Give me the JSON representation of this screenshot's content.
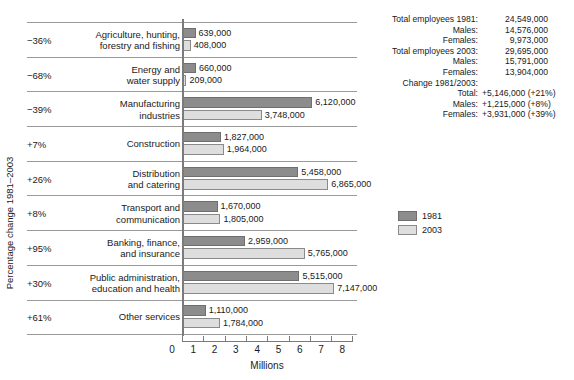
{
  "chart_data": {
    "type": "bar",
    "title": "",
    "xlabel": "Millions",
    "ylabel": "Percentage change 1981–2003",
    "xlim": [
      0,
      8
    ],
    "xticks": [
      0,
      1,
      2,
      3,
      4,
      5,
      6,
      7,
      8
    ],
    "grid": false,
    "legend_position": "right",
    "orientation": "horizontal",
    "categories": [
      "Agriculture, hunting, forestry and fishing",
      "Energy and water supply",
      "Manufacturing industries",
      "Construction",
      "Distribution and catering",
      "Transport and communication",
      "Banking, finance, and insurance",
      "Public administration, education and health",
      "Other services"
    ],
    "series": [
      {
        "name": "1981",
        "color": "#8c8c8c",
        "values": [
          639000,
          660000,
          6120000,
          1827000,
          5458000,
          1670000,
          2959000,
          5515000,
          1110000
        ],
        "labels": [
          "639,000",
          "660,000",
          "6,120,000",
          "1,827,000",
          "5,458,000",
          "1,670,000",
          "2,959,000",
          "5,515,000",
          "1,110,000"
        ]
      },
      {
        "name": "2003",
        "color": "#dedede",
        "values": [
          408000,
          209000,
          3748000,
          1964000,
          6865000,
          1805000,
          5765000,
          7147000,
          1784000
        ],
        "labels": [
          "408,000",
          "209,000",
          "3,748,000",
          "1,964,000",
          "6,865,000",
          "1,805,000",
          "5,765,000",
          "7,147,000",
          "1,784,000"
        ]
      }
    ],
    "annotations": {
      "percent_change": [
        "−36%",
        "−68%",
        "−39%",
        "+7%",
        "+26%",
        "+8%",
        "+95%",
        "+30%",
        "+61%"
      ]
    }
  },
  "rows": [
    {
      "pct": "−36%",
      "cat_line1": "Agriculture, hunting,",
      "cat_line2": "forestry and fishing",
      "v1981": "639,000",
      "v2003": "408,000",
      "n1981": 639000,
      "n2003": 408000
    },
    {
      "pct": "−68%",
      "cat_line1": "Energy and",
      "cat_line2": "water supply",
      "v1981": "660,000",
      "v2003": "209,000",
      "n1981": 660000,
      "n2003": 209000
    },
    {
      "pct": "−39%",
      "cat_line1": "Manufacturing",
      "cat_line2": "industries",
      "v1981": "6,120,000",
      "v2003": "3,748,000",
      "n1981": 6120000,
      "n2003": 3748000
    },
    {
      "pct": "+7%",
      "cat_line1": "Construction",
      "cat_line2": "",
      "v1981": "1,827,000",
      "v2003": "1,964,000",
      "n1981": 1827000,
      "n2003": 1964000
    },
    {
      "pct": "+26%",
      "cat_line1": "Distribution",
      "cat_line2": "and catering",
      "v1981": "5,458,000",
      "v2003": "6,865,000",
      "n1981": 5458000,
      "n2003": 6865000
    },
    {
      "pct": "+8%",
      "cat_line1": "Transport and",
      "cat_line2": "communication",
      "v1981": "1,670,000",
      "v2003": "1,805,000",
      "n1981": 1670000,
      "n2003": 1805000
    },
    {
      "pct": "+95%",
      "cat_line1": "Banking, finance,",
      "cat_line2": "and insurance",
      "v1981": "2,959,000",
      "v2003": "5,765,000",
      "n1981": 2959000,
      "n2003": 5765000
    },
    {
      "pct": "+30%",
      "cat_line1": "Public administration,",
      "cat_line2": "education and health",
      "v1981": "5,515,000",
      "v2003": "7,147,000",
      "n1981": 5515000,
      "n2003": 7147000
    },
    {
      "pct": "+61%",
      "cat_line1": "Other services",
      "cat_line2": "",
      "v1981": "1,110,000",
      "v2003": "1,784,000",
      "n1981": 1110000,
      "n2003": 1784000
    }
  ],
  "axes": {
    "x_title": "Millions",
    "y_title": "Percentage change 1981–2003",
    "x_tick_labels": [
      "0",
      "1",
      "2",
      "3",
      "4",
      "5",
      "6",
      "7",
      "8"
    ]
  },
  "legend": {
    "items": [
      {
        "label": "1981",
        "color": "#8c8c8c"
      },
      {
        "label": "2003",
        "color": "#dedede"
      }
    ]
  },
  "stats": {
    "lines": [
      {
        "label": "Total employees 1981:",
        "value": "24,549,000"
      },
      {
        "label": "Males:",
        "value": "14,576,000"
      },
      {
        "label": "Females:",
        "value": "9,973,000"
      },
      {
        "label": "Total employees 2003:",
        "value": "29,695,000"
      },
      {
        "label": "Males:",
        "value": "15,791,000"
      },
      {
        "label": "Females:",
        "value": "13,904,000"
      },
      {
        "label": "Change 1981/2003:",
        "value": ""
      },
      {
        "label": "Total:",
        "value": "+5,146,000 (+21%)"
      },
      {
        "label": "Males:",
        "value": "+1,215,000  (+8%)"
      },
      {
        "label": "Females:",
        "value": "+3,931,000 (+39%)"
      }
    ]
  }
}
